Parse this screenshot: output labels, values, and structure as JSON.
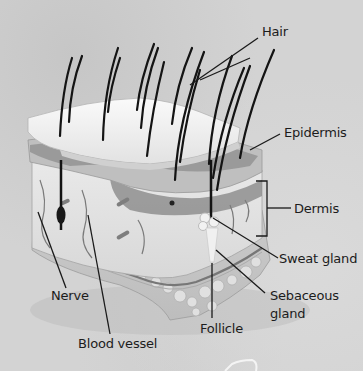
{
  "diagram": {
    "colors": {
      "background": "#d3d3d3",
      "label_text": "#1c1c1c",
      "leader_line": "#1a1a1a",
      "hair": "#141414"
    },
    "labels": {
      "hair": "Hair",
      "epidermis": "Epidermis",
      "dermis": "Dermis",
      "sweat_gland": "Sweat gland",
      "sebaceous_gland_line1": "Sebaceous",
      "sebaceous_gland_line2": "gland",
      "follicle": "Follicle",
      "nerve": "Nerve",
      "blood_vessel": "Blood vessel"
    }
  }
}
